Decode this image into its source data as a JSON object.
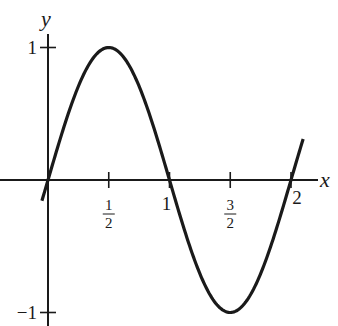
{
  "chart_data": {
    "type": "line",
    "title": "",
    "xlabel": "x",
    "ylabel": "y",
    "xlim": [
      -0.05,
      2.1
    ],
    "ylim": [
      -1,
      1
    ],
    "grid": false,
    "legend": null,
    "series": [
      {
        "name": "y = sin(πx)",
        "function": "sin(pi*x)",
        "x": [
          -0.05,
          0,
          0.25,
          0.5,
          0.75,
          1,
          1.25,
          1.5,
          1.75,
          2,
          2.1
        ],
        "y": [
          -0.156,
          0,
          0.707,
          1,
          0.707,
          0,
          -0.707,
          -1,
          -0.707,
          0,
          0.309
        ]
      }
    ],
    "x_ticks": [
      {
        "value": 0.5,
        "label": {
          "num": "1",
          "den": "2"
        }
      },
      {
        "value": 1,
        "label": "1"
      },
      {
        "value": 1.5,
        "label": {
          "num": "3",
          "den": "2"
        }
      },
      {
        "value": 2,
        "label": "2"
      }
    ],
    "y_ticks": [
      {
        "value": 1,
        "label": "1"
      },
      {
        "value": -1,
        "label": "−1"
      }
    ]
  }
}
